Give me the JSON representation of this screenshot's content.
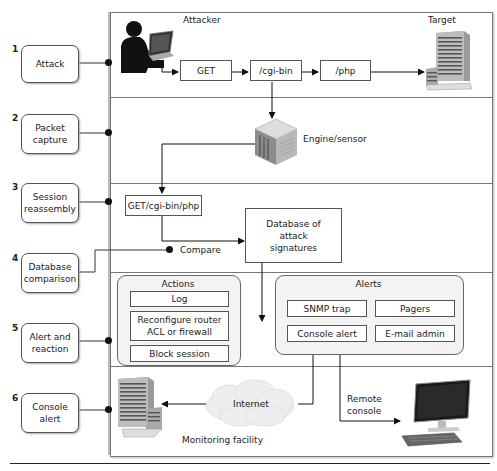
{
  "steps": [
    {
      "number": "1",
      "label": "Attack"
    },
    {
      "number": "2",
      "label": "Packet capture"
    },
    {
      "number": "3",
      "label": "Session reassembly"
    },
    {
      "number": "4",
      "label": "Database comparison"
    },
    {
      "number": "5",
      "label": "Alert and reaction"
    },
    {
      "number": "6",
      "label": "Console alert"
    }
  ],
  "attack": {
    "attacker_label": "Attacker",
    "target_label": "Target",
    "requests": [
      "GET",
      "/cgi-bin",
      "/php"
    ]
  },
  "capture": {
    "engine_label": "Engine/sensor"
  },
  "reassembly": {
    "session_string": "GET/cgi-bin/php",
    "compare_label": "Compare",
    "database_label": "Database of attack signatures"
  },
  "reaction": {
    "actions_title": "Actions",
    "actions": [
      "Log",
      "Reconfigure router ACL or firewall",
      "Block session"
    ],
    "alerts_title": "Alerts",
    "alerts": [
      "SNMP trap",
      "Pagers",
      "Console alert",
      "E-mail admin"
    ]
  },
  "console": {
    "internet_label": "Internet",
    "monitoring_label": "Monitoring facility",
    "remote_console_label": "Remote console"
  },
  "colors": {
    "line": "#222222",
    "frame": "#777777",
    "group_fill": "#f3f3f3"
  }
}
